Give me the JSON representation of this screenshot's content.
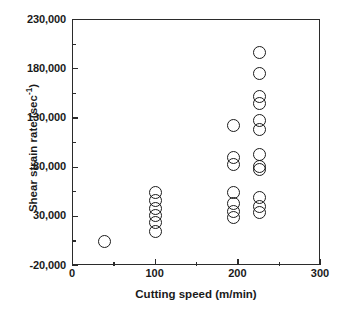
{
  "chart_data": {
    "type": "scatter",
    "title": "",
    "xlabel": "Cutting speed (m/min)",
    "ylabel": "Shear strain rate (sec-1)",
    "ylabel_base": "Shear strain rate (sec",
    "ylabel_exponent": "-1",
    "ylabel_tail": ")",
    "xlim": [
      0,
      300
    ],
    "ylim": [
      -20000,
      230000
    ],
    "grid": false,
    "legend": null,
    "marker": "open-circle",
    "xticks": [
      0,
      100,
      200,
      300
    ],
    "xtick_labels": [
      "0",
      "100",
      "200",
      "300"
    ],
    "xticks_minor": [
      50,
      150,
      250
    ],
    "yticks": [
      -20000,
      30000,
      80000,
      130000,
      180000,
      230000
    ],
    "ytick_labels": [
      "-20,000",
      "30,000",
      "80,000",
      "130,000",
      "180,000",
      "230,000"
    ],
    "yticks_minor": [
      5000,
      55000,
      105000,
      155000,
      205000
    ],
    "points": [
      {
        "x": 38,
        "y": 5000
      },
      {
        "x": 100,
        "y": 55000
      },
      {
        "x": 100,
        "y": 47000
      },
      {
        "x": 100,
        "y": 38000
      },
      {
        "x": 100,
        "y": 31000
      },
      {
        "x": 100,
        "y": 24000
      },
      {
        "x": 100,
        "y": 15000
      },
      {
        "x": 194,
        "y": 123000
      },
      {
        "x": 194,
        "y": 90000
      },
      {
        "x": 194,
        "y": 83000
      },
      {
        "x": 194,
        "y": 55000
      },
      {
        "x": 194,
        "y": 44000
      },
      {
        "x": 194,
        "y": 35000
      },
      {
        "x": 194,
        "y": 29000
      },
      {
        "x": 225,
        "y": 197000
      },
      {
        "x": 225,
        "y": 176000
      },
      {
        "x": 225,
        "y": 152000
      },
      {
        "x": 225,
        "y": 145000
      },
      {
        "x": 225,
        "y": 128000
      },
      {
        "x": 225,
        "y": 119000
      },
      {
        "x": 225,
        "y": 93000
      },
      {
        "x": 225,
        "y": 81000
      },
      {
        "x": 225,
        "y": 78000
      },
      {
        "x": 225,
        "y": 50000
      },
      {
        "x": 225,
        "y": 40000
      },
      {
        "x": 225,
        "y": 34000
      }
    ]
  }
}
